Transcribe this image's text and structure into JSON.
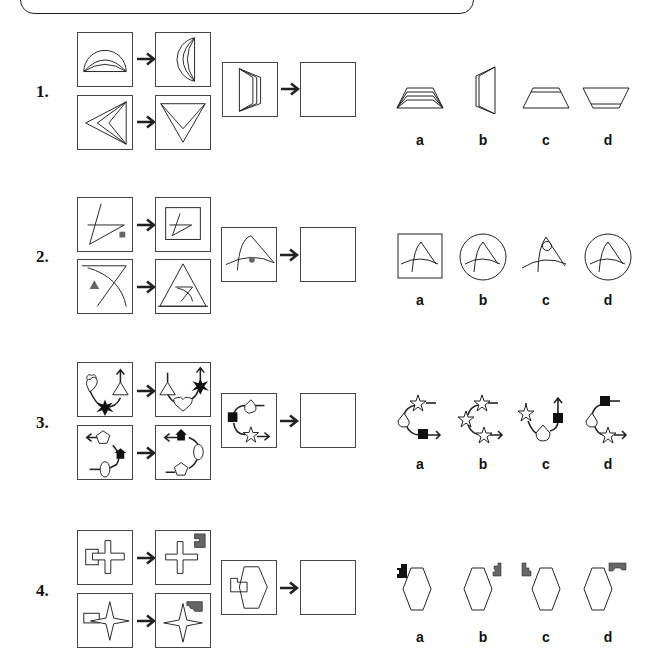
{
  "banner": {
    "text": ""
  },
  "questions": [
    {
      "number": "1.",
      "options": [
        "a",
        "b",
        "c",
        "d"
      ]
    },
    {
      "number": "2.",
      "options": [
        "a",
        "b",
        "c",
        "d"
      ]
    },
    {
      "number": "3.",
      "options": [
        "a",
        "b",
        "c",
        "d"
      ]
    },
    {
      "number": "4.",
      "options": [
        "a",
        "b",
        "c",
        "d"
      ]
    }
  ],
  "colors": {
    "line": "#222222",
    "grey_fill": "#666666",
    "black_fill": "#111111"
  }
}
